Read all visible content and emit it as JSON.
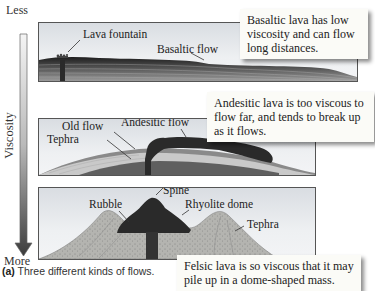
{
  "axis": {
    "title": "Viscosity",
    "top_label": "Less",
    "bottom_label": "More"
  },
  "panels": [
    {
      "name": "basaltic",
      "labels": {
        "fountain": "Lava fountain",
        "flow": "Basaltic flow"
      },
      "callout": "Basaltic lava has low viscosity and can flow long distances."
    },
    {
      "name": "andesitic",
      "labels": {
        "old_flow": "Old flow",
        "tephra": "Tephra",
        "flow": "Andesitic flow"
      },
      "callout": "Andesitic lava is too viscous to flow far, and tends to break up as it flows."
    },
    {
      "name": "felsic",
      "labels": {
        "spine": "Spine",
        "rubble": "Rubble",
        "dome": "Rhyolite dome",
        "tephra": "Tephra"
      },
      "callout": "Felsic lava is so viscous that it may pile up in a dome-shaped mass."
    }
  ],
  "caption": {
    "tag": "(a)",
    "text": " Three different kinds of flows."
  },
  "colors": {
    "arrow_top": "#f2f2f2",
    "arrow_bottom": "#3a3a3a",
    "lava_dark": "#2a2a2a",
    "panel_sky": "#dfe2e6"
  }
}
